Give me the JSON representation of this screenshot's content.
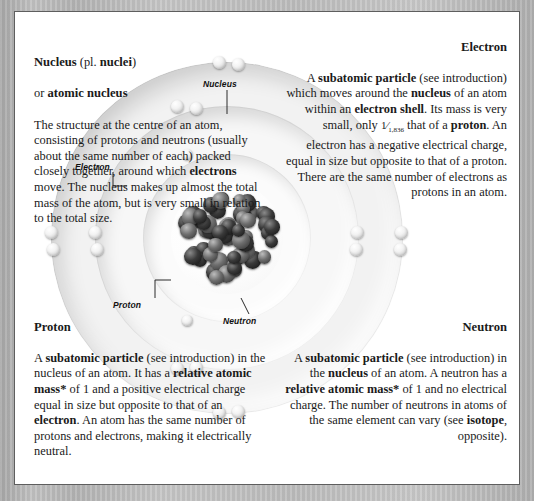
{
  "page": {
    "background_color": "#b9b9b9",
    "card_background": "#ffffff",
    "border_color": "#5e5e5e"
  },
  "entries": {
    "nucleus": {
      "heading_line1_a": "Nucleus",
      "heading_line1_b": " (pl. ",
      "heading_line1_c": "nuclei",
      "heading_line1_d": ")",
      "heading_line2_a": "or ",
      "heading_line2_b": "atomic nucleus",
      "body": "The structure at the centre of an atom, consisting of protons and neutrons (usually about the same number of each) packed closely together, around which electrons move. The nucleus makes up almost the total mass of the atom, but is very small in relation to the total size.",
      "bold_terms": [
        "electrons"
      ]
    },
    "electron": {
      "heading": "Electron",
      "body": "A subatomic particle (see introduction) which moves around the nucleus of an atom within an electron shell. Its mass is very small, only 1/1,836 that of a proton. An electron has a negative electrical charge, equal in size but opposite to that of a proton. There are the same number of electrons as protons in an atom.",
      "fraction_numerator": "1",
      "fraction_denominator": "1,836",
      "bold_terms": [
        "subatomic particle",
        "nucleus",
        "electron shell",
        "proton"
      ]
    },
    "proton": {
      "heading": "Proton",
      "body": "A subatomic particle (see introduction) in the nucleus of an atom. It has a relative atomic mass* of 1 and a positive electrical charge equal in size but opposite to that of an electron. An atom has the same number of protons and electrons, making it electrically neutral.",
      "bold_terms": [
        "subatomic particle",
        "relative atomic mass*",
        "electron"
      ]
    },
    "neutron": {
      "heading": "Neutron",
      "body": "A subatomic particle (see introduction) in the nucleus of an atom. A neutron has a relative atomic mass* of 1 and no electrical charge. The number of neutrons in atoms of the same element can vary (see isotope, opposite).",
      "bold_terms": [
        "subatomic particle",
        "nucleus",
        "relative atomic mass*",
        "isotope"
      ]
    }
  },
  "diagram": {
    "labels": {
      "electron": "Electron",
      "nucleus": "Nucleus",
      "proton": "Proton",
      "neutron": "Neutron"
    },
    "shells": [
      {
        "name": "inner-shell",
        "electron_count": 2
      },
      {
        "name": "middle-shell",
        "electron_count": 8
      },
      {
        "name": "outer-shell",
        "electron_count": 8
      }
    ]
  }
}
